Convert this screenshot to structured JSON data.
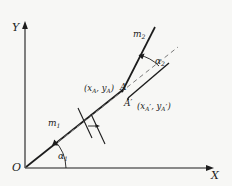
{
  "figure": {
    "background_color": "#f7f7f5",
    "stroke_color": "#1c1c1c",
    "dashed_color": "#6e6e6e"
  },
  "axes": {
    "x_label": "X",
    "y_label": "Y",
    "origin_label": "O"
  },
  "lines": [
    {
      "id": "m1",
      "label": "m",
      "subscript": "1",
      "style": "solid",
      "description": "ray from origin through point A"
    },
    {
      "id": "m2",
      "label": "m",
      "subscript": "2",
      "style": "solid",
      "description": "ray from point A upward and to the right"
    },
    {
      "id": "m1-parallel",
      "label": "",
      "subscript": "",
      "style": "dashed",
      "description": "dashed line parallel to m1 passing through A'"
    }
  ],
  "angles": [
    {
      "id": "alpha1",
      "label": "α",
      "subscript": "1",
      "description": "angle between the X axis and line m1 at the origin"
    },
    {
      "id": "alpha2",
      "label": "α",
      "subscript": "2",
      "description": "angle between line m2 and the dashed direction at the apex"
    }
  ],
  "points": [
    {
      "id": "A",
      "label": "A",
      "prime": false,
      "coordinate_label": "(x",
      "coordinate_sub1": "A",
      "coordinate_mid": ", y",
      "coordinate_sub2": "A",
      "coordinate_end": ")"
    },
    {
      "id": "A-prime",
      "label": "A",
      "prime": true,
      "coordinate_label": "(x",
      "coordinate_sub1": "A",
      "coordinate_mid": ", y",
      "coordinate_sub2": "A",
      "coordinate_end": ")"
    }
  ],
  "marks": {
    "tick_pair_description": "two short perpendicular tick marks across m1 and its dashed parallel",
    "arrow_description": "small arrow between the tick marks indicating translation"
  }
}
